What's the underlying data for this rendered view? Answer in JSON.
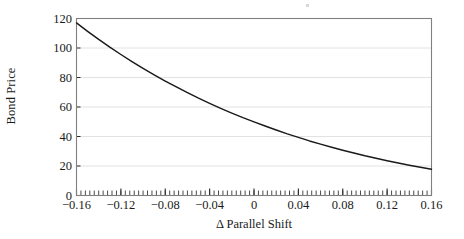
{
  "chart_data": {
    "type": "line",
    "title": "",
    "xlabel": "Δ Parallel Shift",
    "ylabel": "Bond Price",
    "xlim": [
      -0.16,
      0.16
    ],
    "ylim": [
      0,
      120
    ],
    "grid": "horizontal",
    "legend": "none",
    "xticks": [
      -0.16,
      -0.12,
      -0.08,
      -0.04,
      0,
      0.04,
      0.08,
      0.12,
      0.16
    ],
    "xticklabels": [
      "−0.16",
      "−0.12",
      "−0.08",
      "−0.04",
      "0",
      "0.04",
      "0.08",
      "0.12",
      "0.16"
    ],
    "yticks": [
      0,
      20,
      40,
      60,
      80,
      100,
      120
    ],
    "yticklabels": [
      "0",
      "20",
      "40",
      "60",
      "80",
      "100",
      "120"
    ],
    "minor_xtick_step": 0.004,
    "series": [
      {
        "name": "Bond Price",
        "color": "#1a1a1a",
        "x": [
          -0.16,
          -0.15,
          -0.14,
          -0.13,
          -0.12,
          -0.11,
          -0.1,
          -0.09,
          -0.08,
          -0.07,
          -0.06,
          -0.05,
          -0.04,
          -0.03,
          -0.02,
          -0.01,
          0.0,
          0.01,
          0.02,
          0.03,
          0.04,
          0.05,
          0.06,
          0.07,
          0.08,
          0.09,
          0.1,
          0.11,
          0.12,
          0.13,
          0.14,
          0.15,
          0.16
        ],
        "values": [
          117.0,
          111.3,
          105.8,
          100.6,
          95.6,
          90.8,
          86.2,
          81.8,
          77.6,
          73.6,
          69.7,
          66.0,
          62.5,
          59.1,
          55.9,
          52.8,
          49.9,
          47.1,
          44.4,
          41.8,
          39.4,
          37.0,
          34.8,
          32.7,
          30.7,
          28.8,
          26.9,
          25.2,
          23.6,
          22.0,
          20.5,
          19.1,
          17.8
        ]
      }
    ]
  },
  "axes": {
    "y_title": "Bond Price",
    "x_title": "Δ Parallel Shift"
  },
  "style": {
    "curve_color": "#1a1a1a",
    "grid_color": "#e2e2e2",
    "frame_color": "#808080",
    "tick_color": "#2b2b2b",
    "background": "#ffffff"
  }
}
